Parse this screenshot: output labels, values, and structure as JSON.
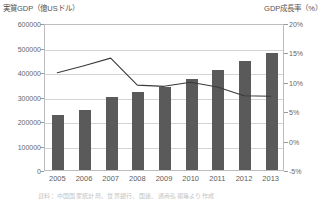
{
  "header": {
    "left_axis_title": "実質GDP（億USドル）",
    "right_axis_title": "GDP成長率（%）"
  },
  "source_note": "資料：中国国家統計局、世界銀行、国連、通商弘報等より作成",
  "chart_data": {
    "type": "bar",
    "title": "",
    "xlabel": "",
    "ylabel": "実質GDP（億USドル）",
    "y2label": "GDP成長率（%）",
    "grid": true,
    "legend_position": "none",
    "categories": [
      "2005",
      "2006",
      "2007",
      "2008",
      "2009",
      "2010",
      "2011",
      "2012",
      "2013"
    ],
    "ylim": [
      0,
      600000
    ],
    "yticks": [
      0,
      100000,
      200000,
      300000,
      400000,
      500000,
      600000
    ],
    "ytick_labels": [
      "0",
      "100000",
      "200000",
      "300000",
      "400000",
      "500000",
      "600000"
    ],
    "y2lim": [
      -5,
      20
    ],
    "y2ticks": [
      -5,
      0,
      5,
      10,
      15,
      20
    ],
    "y2tick_labels": [
      "-5%",
      "0%",
      "5%",
      "10%",
      "15%",
      "20%"
    ],
    "series": [
      {
        "name": "実質GDP（億USドル）",
        "type": "bar",
        "axis": "left",
        "color": "#5a5a5a",
        "values": [
          224000,
          245000,
          298000,
          318000,
          339000,
          371000,
          410000,
          445000,
          478000
        ]
      },
      {
        "name": "GDP成長率（%）",
        "type": "line",
        "axis": "right",
        "color": "#3a3a3a",
        "values": [
          11.7,
          12.9,
          14.2,
          9.6,
          9.4,
          10.1,
          9.3,
          7.8,
          7.7
        ]
      }
    ]
  }
}
